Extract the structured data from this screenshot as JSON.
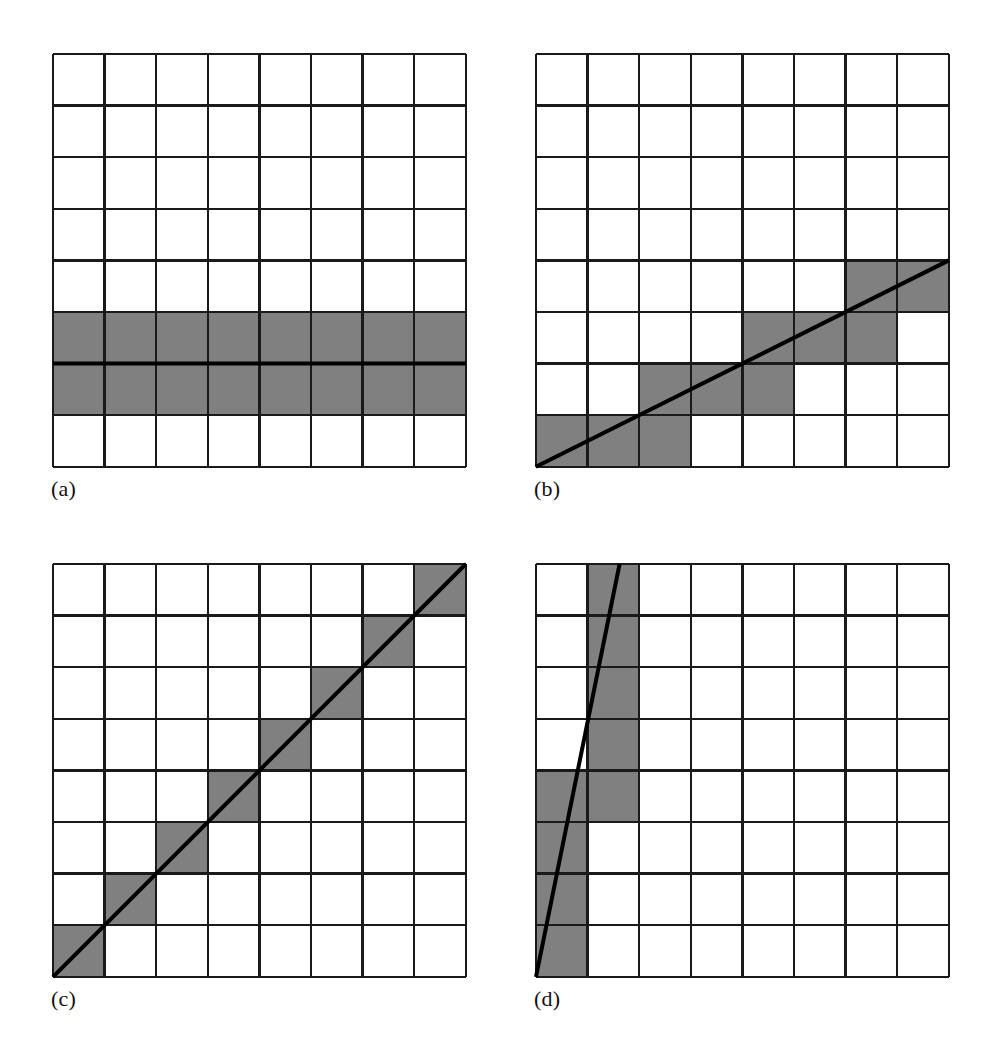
{
  "figure": {
    "background_color": "#ffffff",
    "grid_line_color": "#1a1a1a",
    "grid_line_width": 2.4,
    "cell_fill_color": "#ffffff",
    "shaded_cell_color": "#808080",
    "line_color": "#000000",
    "line_width": 4.0,
    "grid_columns": 8,
    "grid_rows": 8,
    "cell_size_px": 51.6
  },
  "panels": [
    {
      "id": "panel-a",
      "label": "(a)",
      "origin_x": 53,
      "origin_y": 54,
      "label_x": 51,
      "label_y": 478,
      "description": "Horizontal line, slope 0, two fully shaded rows",
      "line": {
        "x1": 0,
        "y1": 6,
        "x2": 8,
        "y2": 6
      },
      "shaded_cells": [
        [
          0,
          5
        ],
        [
          1,
          5
        ],
        [
          2,
          5
        ],
        [
          3,
          5
        ],
        [
          4,
          5
        ],
        [
          5,
          5
        ],
        [
          6,
          5
        ],
        [
          7,
          5
        ],
        [
          0,
          6
        ],
        [
          1,
          6
        ],
        [
          2,
          6
        ],
        [
          3,
          6
        ],
        [
          4,
          6
        ],
        [
          5,
          6
        ],
        [
          6,
          6
        ],
        [
          7,
          6
        ]
      ]
    },
    {
      "id": "panel-b",
      "label": "(b)",
      "origin_x": 536,
      "origin_y": 54,
      "label_x": 534,
      "label_y": 478,
      "description": "Shallow line, slope about one half, staircase of shaded cells",
      "line": {
        "x1": 0,
        "y1": 8,
        "x2": 8,
        "y2": 4
      },
      "shaded_cells": [
        [
          0,
          7
        ],
        [
          1,
          7
        ],
        [
          2,
          7
        ],
        [
          2,
          6
        ],
        [
          3,
          6
        ],
        [
          4,
          6
        ],
        [
          4,
          5
        ],
        [
          5,
          5
        ],
        [
          6,
          5
        ],
        [
          6,
          4
        ],
        [
          7,
          4
        ]
      ]
    },
    {
      "id": "panel-c",
      "label": "(c)",
      "origin_x": 53,
      "origin_y": 564,
      "label_x": 51,
      "label_y": 988,
      "description": "Forty five degree diagonal, slope one, single shaded cell per row",
      "line": {
        "x1": 0,
        "y1": 8,
        "x2": 8,
        "y2": 0
      },
      "shaded_cells": [
        [
          0,
          7
        ],
        [
          1,
          6
        ],
        [
          2,
          5
        ],
        [
          3,
          4
        ],
        [
          4,
          3
        ],
        [
          5,
          2
        ],
        [
          6,
          1
        ],
        [
          7,
          0
        ]
      ]
    },
    {
      "id": "panel-d",
      "label": "(d)",
      "origin_x": 536,
      "origin_y": 564,
      "label_x": 534,
      "label_y": 988,
      "description": "Steep line, large slope, shaded cells stacked in two columns",
      "line": {
        "x1": 0,
        "y1": 8,
        "x2": 1.62,
        "y2": 0
      },
      "shaded_cells": [
        [
          0,
          7
        ],
        [
          0,
          6
        ],
        [
          0,
          5
        ],
        [
          0,
          4
        ],
        [
          1,
          4
        ],
        [
          1,
          3
        ],
        [
          1,
          2
        ],
        [
          1,
          1
        ],
        [
          1,
          0
        ]
      ]
    }
  ]
}
